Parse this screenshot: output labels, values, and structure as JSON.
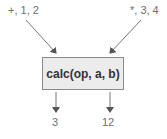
{
  "diagram": {
    "inputs": [
      {
        "label": "+, 1, 2"
      },
      {
        "label": "*, 3, 4"
      }
    ],
    "function": {
      "label": "calc(op, a, b)"
    },
    "outputs": [
      {
        "label": "3"
      },
      {
        "label": "12"
      }
    ],
    "colors": {
      "box_fill": "#ececec",
      "box_border": "#8a8a8a",
      "arrow": "#666666",
      "text": "#6e6e6e"
    }
  }
}
